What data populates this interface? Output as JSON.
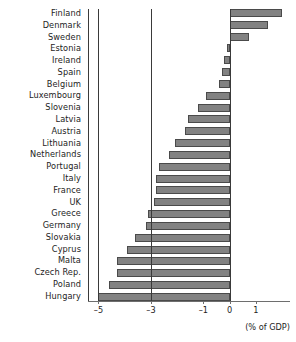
{
  "chart_data": {
    "type": "bar",
    "orientation": "horizontal",
    "title": "",
    "subtitle": "",
    "xlabel": "(% of GDP)",
    "ylabel": "",
    "xlim": [
      -5.4,
      2.3
    ],
    "grid": false,
    "legend": null,
    "bar_color": "#828282",
    "bar_edge_color": "#4a4a4a",
    "axis_color": "#3a3a3a",
    "reference_lines": [
      -5,
      -3,
      0
    ],
    "xticks": [
      -5,
      -3,
      -1,
      0,
      1
    ],
    "xtick_labels": [
      "–5",
      "–3",
      "–1",
      "0",
      "1"
    ],
    "categories": [
      "Finland",
      "Denmark",
      "Sweden",
      "Estonia",
      "Ireland",
      "Spain",
      "Belgium",
      "Luxembourg",
      "Slovenia",
      "Latvia",
      "Austria",
      "Lithuania",
      "Netherlands",
      "Portugal",
      "Italy",
      "France",
      "UK",
      "Greece",
      "Germany",
      "Slovakia",
      "Cyprus",
      "Malta",
      "Czech Rep.",
      "Poland",
      "Hungary"
    ],
    "values": [
      2.0,
      1.45,
      0.75,
      -0.1,
      -0.2,
      -0.3,
      -0.4,
      -0.9,
      -1.2,
      -1.6,
      -1.7,
      -2.1,
      -2.3,
      -2.7,
      -2.8,
      -2.8,
      -2.9,
      -3.1,
      -3.2,
      -3.6,
      -3.9,
      -4.3,
      -4.3,
      -4.6,
      -5.0
    ]
  },
  "axis": {
    "unit_label": "(% of GDP)"
  }
}
